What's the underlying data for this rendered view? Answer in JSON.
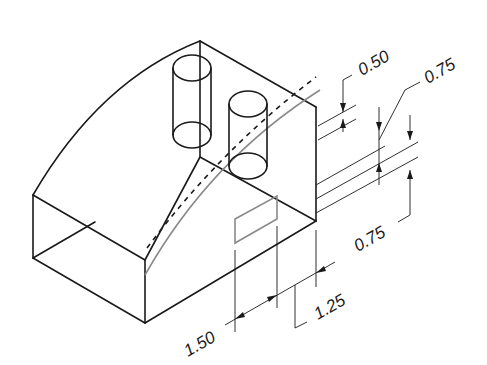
{
  "drawing": {
    "type": "isometric technical drawing",
    "colors": {
      "line": "#1a1a1a",
      "feature": "#8a8a8a",
      "background": "#ffffff"
    },
    "dimensions": [
      {
        "id": "d1",
        "label": "0.50"
      },
      {
        "id": "d2",
        "label": "0.75"
      },
      {
        "id": "d3",
        "label": "0.75"
      },
      {
        "id": "d4",
        "label": "1.50"
      },
      {
        "id": "d5",
        "label": "1.25"
      }
    ]
  }
}
